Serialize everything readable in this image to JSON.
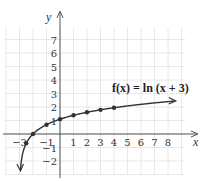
{
  "chart_data": {
    "type": "line",
    "title": "",
    "annotation": "f(x) = ln (x + 3)",
    "xlabel": "x",
    "ylabel": "y",
    "xlim": [
      -4,
      9
    ],
    "ylim": [
      -3,
      8
    ],
    "grid": true,
    "x_ticks": [
      -3,
      -1,
      1,
      2,
      3,
      4,
      5,
      6,
      7,
      8
    ],
    "y_ticks": [
      -2,
      -1,
      1,
      2,
      3,
      4,
      5,
      6,
      7
    ],
    "series": [
      {
        "name": "f(x) = ln (x + 3)",
        "function": "ln(x + 3)",
        "marked_points": [
          {
            "x": -2.5,
            "y": -0.69
          },
          {
            "x": -2,
            "y": 0
          },
          {
            "x": -1,
            "y": 0.69
          },
          {
            "x": 0,
            "y": 1.1
          },
          {
            "x": 1,
            "y": 1.39
          },
          {
            "x": 2,
            "y": 1.61
          },
          {
            "x": 3,
            "y": 1.79
          },
          {
            "x": 4,
            "y": 1.95
          }
        ],
        "curve_domain": [
          -2.93,
          8.5
        ],
        "arrows": [
          "down-left",
          "right"
        ]
      }
    ]
  },
  "colors": {
    "grid": "#e2e2e2",
    "axis": "#555555",
    "curve": "#333333",
    "background": "#ffffff"
  }
}
